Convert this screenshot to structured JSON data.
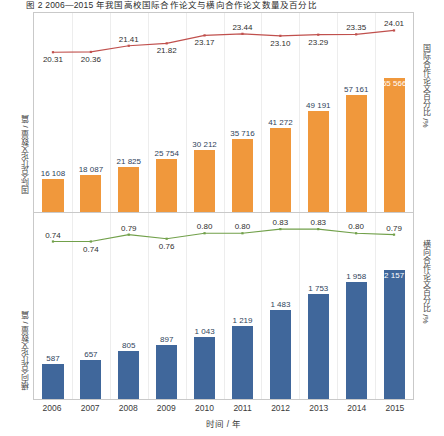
{
  "figure": {
    "title": "图 2  2006—2015 年我国高校国际合作论文与横向合作论文数量及百分比",
    "xlabel": "时间 / 年",
    "years": [
      "2006",
      "2007",
      "2008",
      "2009",
      "2010",
      "2011",
      "2012",
      "2013",
      "2014",
      "2015"
    ],
    "colors": {
      "bar_orange": "#f0983c",
      "bar_blue": "#40679b",
      "line_red": "#c0504d",
      "line_green": "#71a04a",
      "frame": "#c9c9c9",
      "grid": "#ededed"
    }
  },
  "top_panel": {
    "y_left_title": "国际合作论文数量 / 篇",
    "y_right_title": "国际合作论文百分比 /%"
  },
  "bottom_panel": {
    "y_left_title": "横向合作论文数量 / 篇",
    "y_right_title": "横向合作论文百分比 /%"
  },
  "chart_data": [
    {
      "type": "bar",
      "id": "international-collaboration",
      "title": "国际合作论文数量及百分比",
      "xlabel": "时间 / 年",
      "ylabel": "国际合作论文数量 / 篇",
      "y2label": "国际合作论文百分比 /%",
      "categories": [
        "2006",
        "2007",
        "2008",
        "2009",
        "2010",
        "2011",
        "2012",
        "2013",
        "2014",
        "2015"
      ],
      "grid": false,
      "legend": "none",
      "ylim": [
        0,
        70000
      ],
      "y2lim": [
        19.5,
        24.6
      ],
      "series": [
        {
          "name": "国际合作论文数量 / 篇",
          "kind": "bar",
          "axis": "left",
          "color": "#f0983c",
          "values": [
            16108,
            18087,
            21825,
            25754,
            30212,
            35716,
            41272,
            49191,
            57161,
            65566
          ],
          "labels": [
            "16 108",
            "18 087",
            "21 825",
            "25 754",
            "30 212",
            "35 716",
            "41 272",
            "49 191",
            "57 161",
            "65 566"
          ]
        },
        {
          "name": "国际合作论文百分比 /%",
          "kind": "line",
          "axis": "right",
          "color": "#c0504d",
          "values": [
            20.31,
            20.36,
            21.41,
            21.82,
            23.17,
            23.44,
            23.1,
            23.29,
            23.35,
            24.01
          ],
          "labels": [
            "20.31",
            "20.36",
            "21.41",
            "21.82",
            "23.17",
            "23.44",
            "23.10",
            "23.29",
            "23.35",
            "24.01"
          ]
        }
      ]
    },
    {
      "type": "bar",
      "id": "horizontal-collaboration",
      "title": "横向合作论文数量及百分比",
      "xlabel": "时间 / 年",
      "ylabel": "横向合作论文数量 / 篇",
      "y2label": "横向合作论文百分比 /%",
      "categories": [
        "2006",
        "2007",
        "2008",
        "2009",
        "2010",
        "2011",
        "2012",
        "2013",
        "2014",
        "2015"
      ],
      "grid": false,
      "legend": "none",
      "ylim": [
        0,
        2300
      ],
      "y2lim": [
        0.7,
        0.86
      ],
      "series": [
        {
          "name": "横向合作论文数量 / 篇",
          "kind": "bar",
          "axis": "left",
          "color": "#40679b",
          "values": [
            587,
            657,
            805,
            897,
            1043,
            1219,
            1483,
            1753,
            1958,
            2157
          ],
          "labels": [
            "587",
            "657",
            "805",
            "897",
            "1 043",
            "1 219",
            "1 483",
            "1 753",
            "1 958",
            "2 157"
          ]
        },
        {
          "name": "横向合作论文百分比 /%",
          "kind": "line",
          "axis": "right",
          "color": "#71a04a",
          "values": [
            0.74,
            0.74,
            0.79,
            0.76,
            0.8,
            0.8,
            0.83,
            0.83,
            0.8,
            0.79
          ],
          "labels": [
            "0.74",
            "0.74",
            "0.79",
            "0.76",
            "0.80",
            "0.80",
            "0.83",
            "0.83",
            "0.80",
            "0.79"
          ]
        }
      ]
    }
  ]
}
